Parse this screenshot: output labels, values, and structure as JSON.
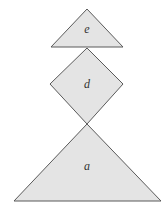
{
  "diagram": {
    "type": "stacked-shapes",
    "colors": {
      "fill": "#e4e4e4",
      "stroke": "#5a5a5a",
      "label": "#333333",
      "background": "#ffffff"
    },
    "shapes": [
      {
        "id": "e",
        "kind": "triangle",
        "label": "e",
        "points": "87,9 51,47 123,47",
        "label_pos": {
          "x": 87,
          "y": 33
        }
      },
      {
        "id": "d",
        "kind": "diamond",
        "label": "d",
        "points": "87,48 123,84 87,124 50,84",
        "label_pos": {
          "x": 87,
          "y": 88
        }
      },
      {
        "id": "a",
        "kind": "triangle",
        "label": "a",
        "points": "87,124 161,201 14,201",
        "label_pos": {
          "x": 87,
          "y": 170
        }
      }
    ]
  }
}
